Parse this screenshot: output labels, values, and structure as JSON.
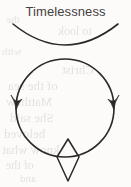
{
  "page": {
    "width": 131,
    "height": 187,
    "background_color": "#fcfbf9",
    "ink_color": "#2b2826"
  },
  "title": {
    "text": "Timelessness",
    "color": "#44413f"
  },
  "diagram": {
    "name": "timelessness-symbol",
    "elements": [
      {
        "id": "top-arc",
        "label": "downward-opening arc",
        "shape": "arc",
        "from": [
          13,
          24
        ],
        "to": [
          118,
          24
        ],
        "apex": [
          65,
          49
        ]
      },
      {
        "id": "circle",
        "label": "circle",
        "shape": "circle",
        "center_x": 65,
        "center_y": 108,
        "radius": 49
      },
      {
        "id": "arrow-left",
        "label": "left downward arrowhead",
        "shape": "arrowhead",
        "at": [
          16,
          103
        ],
        "direction": "down"
      },
      {
        "id": "arrow-right",
        "label": "right downward arrowhead",
        "shape": "arrowhead",
        "at": [
          114,
          103
        ],
        "direction": "down"
      },
      {
        "id": "diamond",
        "label": "elongated diamond",
        "shape": "rhombus",
        "center_x": 68,
        "top_y": 139,
        "bottom_y": 181,
        "half_width": 11
      }
    ]
  },
  "bleed_text": {
    "note": "faint reversed text showing through the paper from the other side",
    "color": "#8f8a86",
    "lines": [
      {
        "text": "the",
        "left": 6,
        "top": 13,
        "size": 11
      },
      {
        "text": "to look",
        "left": 58,
        "top": 24,
        "size": 12
      },
      {
        "text": "with",
        "left": 2,
        "top": 45,
        "size": 11
      },
      {
        "text": "Christ",
        "left": 62,
        "top": 62,
        "size": 13
      },
      {
        "text": "of the sea",
        "left": 8,
        "top": 78,
        "size": 13
      },
      {
        "text": "Matthew",
        "left": 6,
        "top": 94,
        "size": 13
      },
      {
        "text": "She said",
        "left": 10,
        "top": 110,
        "size": 13
      },
      {
        "text": "beloved",
        "left": 4,
        "top": 126,
        "size": 13
      },
      {
        "text": "know what",
        "left": 2,
        "top": 142,
        "size": 13
      },
      {
        "text": "of the",
        "left": 6,
        "top": 158,
        "size": 12
      },
      {
        "text": "and",
        "left": 20,
        "top": 172,
        "size": 11
      }
    ]
  }
}
